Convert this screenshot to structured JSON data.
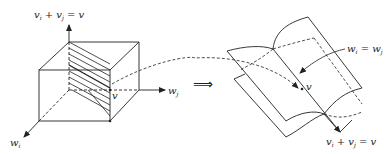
{
  "figure": {
    "left_panel": {
      "axis_vertical_label": {
        "v": "v",
        "i": "i",
        "plus": " + ",
        "v2": "v",
        "j": "j",
        "eq": " = ",
        "rhs": "v"
      },
      "axis_right_label": {
        "w": "w",
        "j": "j"
      },
      "axis_left_label": {
        "w": "w",
        "i": "i"
      },
      "point_label": "v"
    },
    "implies_symbol": "⟹",
    "right_panel": {
      "surface_label": {
        "w1": "w",
        "i": "i",
        "eq": " = ",
        "w2": "w",
        "j": "j"
      },
      "point_label": "v",
      "line_label": {
        "v": "v",
        "i": "i",
        "plus": " + ",
        "v2": "v",
        "j": "j",
        "eq": " = ",
        "rhs": "v"
      }
    },
    "colors": {
      "stroke": "#222222",
      "background": "#ffffff"
    }
  }
}
